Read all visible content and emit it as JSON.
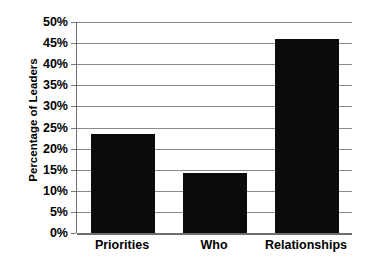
{
  "chart_data": {
    "type": "bar",
    "title": "",
    "subtitle": "",
    "xlabel": "",
    "ylabel": "Percentage of Leaders",
    "categories": [
      "Priorities",
      "Who",
      "Relationships"
    ],
    "values": [
      23.5,
      14.3,
      46.0
    ],
    "value_labels": [
      "23.5%",
      "14.3%",
      "46.0%"
    ],
    "ylim": [
      0,
      50
    ],
    "ytick_step": 5,
    "ytick_labels": [
      "0%",
      "5%",
      "10%",
      "15%",
      "20%",
      "25%",
      "30%",
      "35%",
      "40%",
      "45%",
      "50%"
    ],
    "ytick_values": [
      0,
      5,
      10,
      15,
      20,
      25,
      30,
      35,
      40,
      45,
      50
    ],
    "grid": true,
    "grid_axis": "y",
    "legend": false,
    "legend_position": "none",
    "bar_color": "#0b0b0b",
    "gridline_color": "#8a8a8a",
    "axis_color": "#6e6e6e",
    "background_color": "#ffffff"
  }
}
